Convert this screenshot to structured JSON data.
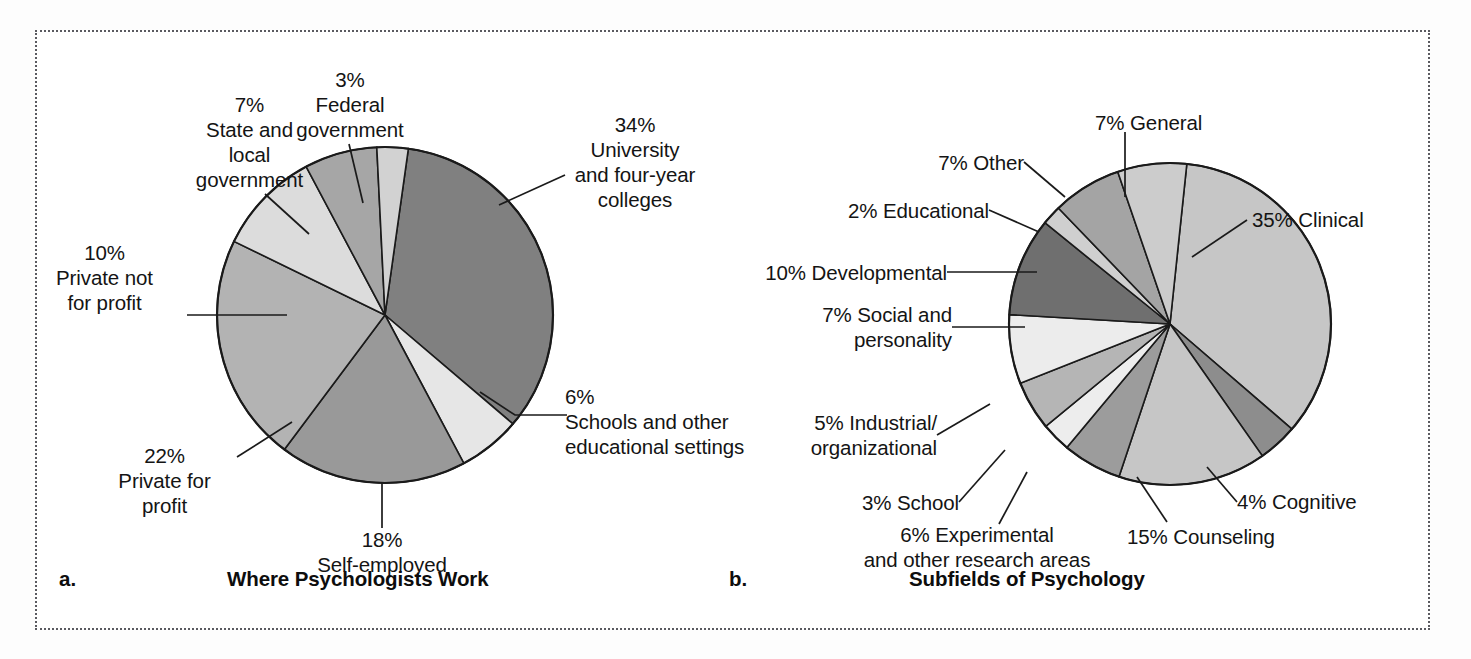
{
  "figure": {
    "panel_a_letter": "a.",
    "panel_b_letter": "b.",
    "panel_a_caption": "Where Psychologists Work",
    "panel_b_caption": "Subfields of Psychology"
  },
  "chart_data": [
    {
      "type": "pie",
      "title": "Where Psychologists Work",
      "panel": "a",
      "unit": "percent",
      "grid": false,
      "legend_position": "none (direct labels with leader lines)",
      "categories": [
        "University and four-year colleges",
        "Schools and other educational settings",
        "Self-employed",
        "Private for profit",
        "Private not for profit",
        "State and local government",
        "Federal government"
      ],
      "values": [
        34,
        6,
        18,
        22,
        10,
        7,
        3
      ],
      "labels": [
        "34%\nUniversity\nand four-year\ncolleges",
        "6%\nSchools and other\neducational settings",
        "18%\nSelf-employed",
        "22%\nPrivate for\nprofit",
        "10%\nPrivate not\nfor profit",
        "7%\nState and\nlocal\ngovernment",
        "3%\nFederal\ngovernment"
      ],
      "slice_colors": [
        "#808080",
        "#e6e6e6",
        "#999999",
        "#b3b3b3",
        "#dcdcdc",
        "#a6a6a6",
        "#d2d2d2"
      ]
    },
    {
      "type": "pie",
      "title": "Subfields of Psychology",
      "panel": "b",
      "unit": "percent",
      "grid": false,
      "legend_position": "none (direct labels with leader lines)",
      "categories": [
        "Clinical",
        "Cognitive",
        "Counseling",
        "Experimental and other research areas",
        "School",
        "Industrial/organizational",
        "Social and personality",
        "Developmental",
        "Educational",
        "Other",
        "General"
      ],
      "values": [
        35,
        4,
        15,
        6,
        3,
        5,
        7,
        10,
        2,
        7,
        7
      ],
      "labels": [
        "35% Clinical",
        "4% Cognitive",
        "15% Counseling",
        "6% Experimental\nand other research areas",
        "3% School",
        "5% Industrial/\norganizational",
        "7% Social and\npersonality",
        "10% Developmental",
        "2% Educational",
        "7% Other",
        "7% General"
      ],
      "slice_colors": [
        "#c6c6c6",
        "#8d8d8d",
        "#c6c6c6",
        "#9c9c9c",
        "#ededed",
        "#b5b5b5",
        "#ececec",
        "#6f6f6f",
        "#cfcfcf",
        "#a4a4a4",
        "#cccccc"
      ]
    }
  ],
  "labels_a": {
    "university": "34%\nUniversity\nand four-year\ncolleges",
    "schools": "6%\nSchools and other\neducational settings",
    "self_employed": "18%\nSelf-employed",
    "private_for_profit": "22%\nPrivate for\nprofit",
    "private_not_for_profit": "10%\nPrivate not\nfor profit",
    "state_local": "7%\nState and\nlocal\ngovernment",
    "federal": "3%\nFederal\ngovernment"
  },
  "labels_b": {
    "general": "7% General",
    "clinical": "35% Clinical",
    "cognitive": "4% Cognitive",
    "counseling": "15% Counseling",
    "experimental": "6% Experimental\nand other research areas",
    "school": "3% School",
    "industrial": "5% Industrial/\norganizational",
    "social": "7% Social and\npersonality",
    "developmental": "10% Developmental",
    "educational": "2% Educational",
    "other": "7% Other"
  },
  "colors": {
    "stroke": "#1a1a1a",
    "frame": "#5a5a60",
    "text": "#141414"
  }
}
